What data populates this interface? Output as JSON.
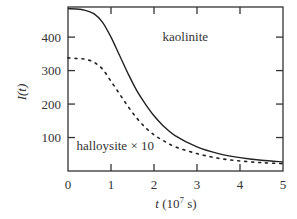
{
  "chart_data": {
    "type": "line",
    "title": "",
    "xlabel": "t (10^7 s)",
    "xlabel_parts": {
      "var": "t",
      "open": " (10",
      "exp": "7",
      "close": " s)"
    },
    "ylabel": "I(t)",
    "ylabel_parts": {
      "var": "I",
      "arg": "(t)"
    },
    "xlim": [
      0,
      5
    ],
    "ylim": [
      0,
      490
    ],
    "xticks": [
      0,
      1,
      2,
      3,
      4,
      5
    ],
    "yticks": [
      100,
      200,
      300,
      400
    ],
    "grid": false,
    "legend": "inline annotations",
    "series": [
      {
        "name": "kaolinite",
        "style": "solid",
        "x": [
          0,
          0.2,
          0.4,
          0.6,
          0.8,
          1.0,
          1.2,
          1.4,
          1.6,
          1.8,
          2.0,
          2.2,
          2.5,
          3.0,
          3.5,
          4.0,
          4.5,
          5.0
        ],
        "y": [
          485,
          484,
          480,
          470,
          445,
          400,
          345,
          290,
          240,
          200,
          165,
          137,
          105,
          72,
          52,
          40,
          32,
          27
        ]
      },
      {
        "name": "halloysite × 10",
        "style": "dotted",
        "x": [
          0,
          0.2,
          0.4,
          0.6,
          0.8,
          1.0,
          1.2,
          1.4,
          1.6,
          1.8,
          2.0,
          2.2,
          2.5,
          3.0,
          3.5,
          4.0,
          4.5,
          5.0
        ],
        "y": [
          338,
          336,
          334,
          325,
          305,
          268,
          230,
          192,
          158,
          130,
          108,
          92,
          72,
          52,
          38,
          30,
          25,
          22
        ]
      }
    ],
    "annotations": [
      {
        "text": "kaolinite",
        "x": 2.2,
        "y": 400
      },
      {
        "text": "halloysite × 10",
        "x": 0.2,
        "y": 75
      }
    ]
  }
}
